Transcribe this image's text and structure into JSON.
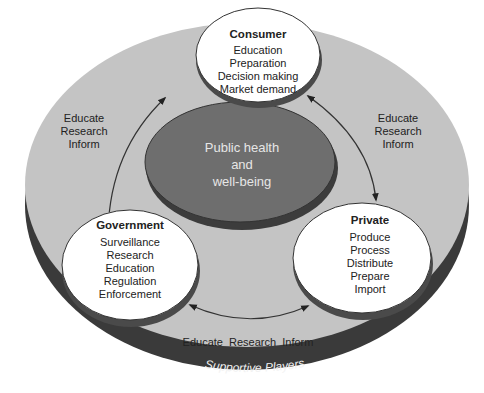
{
  "diagram": {
    "outer_ring": {
      "label": "Supportive Players"
    },
    "center": {
      "lines": [
        "Public health",
        "and",
        "well-being"
      ]
    },
    "nodes": {
      "consumer": {
        "title": "Consumer",
        "items": [
          "Education",
          "Preparation",
          "Decision making",
          "Market demand"
        ]
      },
      "government": {
        "title": "Government",
        "items": [
          "Surveillance",
          "Research",
          "Education",
          "Regulation",
          "Enforcement"
        ]
      },
      "private": {
        "title": "Private",
        "items": [
          "Produce",
          "Process",
          "Distribute",
          "Prepare",
          "Import"
        ]
      }
    },
    "links": {
      "left": [
        "Educate",
        "Research",
        "Inform"
      ],
      "right": [
        "Educate",
        "Research",
        "Inform"
      ],
      "bottom": "Educate  Research  Inform"
    },
    "colors": {
      "outer_top": "#c4c4c4",
      "outer_band": "#3a3a3a",
      "center_top": "#6e6e6e",
      "center_side": "#3c3c3c",
      "node_fill": "#ffffff",
      "node_side": "#4a4a4a",
      "center_text": "#e6e6e6",
      "band_text": "#f2f2f2"
    }
  }
}
